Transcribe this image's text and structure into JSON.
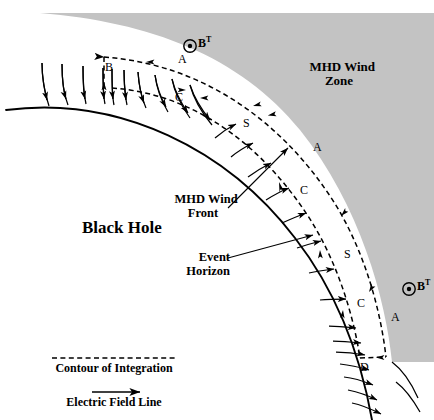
{
  "figure": {
    "title_region": "MHD wind zone around a black hole event horizon",
    "colors": {
      "wind_zone_fill": "#c3c3c3",
      "line": "#000000",
      "background": "#ffffff"
    }
  },
  "labels": {
    "mhd_wind_zone": "MHD Wind\nZone",
    "black_hole": "Black Hole",
    "mhd_wind_front": "MHD Wind\nFront",
    "event_horizon": "Event\nHorizon",
    "b_toroidal_top": "B",
    "b_toroidal_top_sup": "T",
    "b_toroidal_bottom": "B",
    "b_toroidal_bottom_sup": "T"
  },
  "contour_segments": [
    {
      "id": "A-top",
      "label": "A"
    },
    {
      "id": "B-left",
      "label": "B"
    },
    {
      "id": "C-top",
      "label": "C"
    },
    {
      "id": "S-upper",
      "label": "S"
    },
    {
      "id": "A-mid",
      "label": "A"
    },
    {
      "id": "C-mid",
      "label": "C"
    },
    {
      "id": "S-lower",
      "label": "S"
    },
    {
      "id": "C-lower",
      "label": "C"
    },
    {
      "id": "A-lower",
      "label": "A"
    },
    {
      "id": "D-bottom",
      "label": "D"
    }
  ],
  "legend": {
    "items": [
      {
        "icon": "dashed-line-icon",
        "label": "Contour of Integration"
      },
      {
        "icon": "arrow-line-icon",
        "label": "Electric Field Line"
      }
    ]
  },
  "icons": {
    "field_out_of_page": "circle-dot-icon"
  }
}
